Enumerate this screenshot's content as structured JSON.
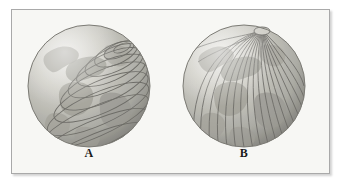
{
  "figure": {
    "background_color": "#f7f7f4",
    "border_color": "#a9a9a9",
    "outer_background": "#ffffff",
    "caption_a": "A",
    "caption_b": "B"
  },
  "globes": [
    {
      "id": "globe-a",
      "label": "A",
      "grid_type": "latitude",
      "grid_name": "parallels",
      "line_count": 12,
      "center_x": 77,
      "center_y": 76,
      "radius": 61,
      "pole_x": 110,
      "pole_y": 38,
      "pole_cap_radius": 9,
      "sphere_light_color": "#dddcd6",
      "sphere_mid_color": "#b9b8b1",
      "sphere_dark_color": "#8e8d87",
      "grid_line_color": "#6f6e69",
      "land_color": "#9d9c95",
      "highlight_color": "#f1f0ea"
    },
    {
      "id": "globe-b",
      "label": "B",
      "grid_type": "longitude",
      "grid_name": "meridians",
      "line_count": 20,
      "center_x": 232,
      "center_y": 76,
      "radius": 61,
      "pole_x": 250,
      "pole_y": 20,
      "pole_cap_radius": 8,
      "sphere_light_color": "#dddcd6",
      "sphere_mid_color": "#b9b8b1",
      "sphere_dark_color": "#8e8d87",
      "grid_line_color": "#6f6e69",
      "land_color": "#9d9c95",
      "highlight_color": "#f1f0ea"
    }
  ]
}
